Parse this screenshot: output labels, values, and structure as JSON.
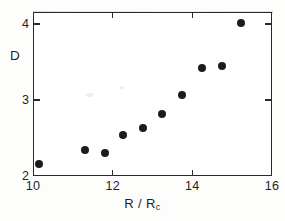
{
  "chart_data": {
    "type": "scatter",
    "title": "",
    "xlabel": "R / R",
    "xlabel_sub": "c",
    "ylabel": "D",
    "xlim": [
      10,
      16
    ],
    "ylim": [
      2,
      4.15
    ],
    "grid": false,
    "legend": null,
    "x_ticks": [
      {
        "value": 10,
        "label": "10"
      },
      {
        "value": 12,
        "label": "12"
      },
      {
        "value": 14,
        "label": "14"
      },
      {
        "value": 16,
        "label": "16"
      }
    ],
    "y_ticks": [
      {
        "value": 2,
        "label": "2"
      },
      {
        "value": 3,
        "label": "3"
      },
      {
        "value": 4,
        "label": "4"
      }
    ],
    "marker": "filled-circle",
    "marker_color": "#1c1c1c",
    "points": [
      {
        "x": 10.15,
        "y": 2.16
      },
      {
        "x": 11.3,
        "y": 2.34
      },
      {
        "x": 11.8,
        "y": 2.3
      },
      {
        "x": 12.25,
        "y": 2.54
      },
      {
        "x": 12.75,
        "y": 2.63
      },
      {
        "x": 13.25,
        "y": 2.81
      },
      {
        "x": 13.75,
        "y": 3.07
      },
      {
        "x": 14.25,
        "y": 3.42
      },
      {
        "x": 14.75,
        "y": 3.45
      },
      {
        "x": 15.23,
        "y": 4.01
      }
    ]
  }
}
